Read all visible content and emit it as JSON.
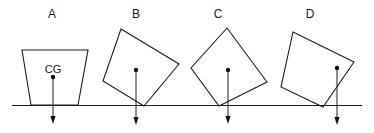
{
  "figure": {
    "colors": {
      "line": "#1e1e1e",
      "background": "#ffffff"
    },
    "ground": {
      "x1": 12,
      "y1": 105.5,
      "x2": 362,
      "y2": 105.5
    },
    "cg_label": "CG",
    "objects": [
      {
        "id": "A",
        "label": "A",
        "label_pos": [
          52,
          18
        ],
        "points": "22,50 88,50 78,105 31,105",
        "cg": [
          53,
          77
        ],
        "arrow_end_y": 124,
        "show_cg_label": true,
        "cg_label_pos": [
          53,
          73
        ]
      },
      {
        "id": "B",
        "label": "B",
        "label_pos": [
          136,
          18
        ],
        "points": "121,29 179,64 144,106 103,81",
        "cg": [
          136,
          70
        ],
        "arrow_end_y": 125,
        "show_cg_label": false
      },
      {
        "id": "C",
        "label": "C",
        "label_pos": [
          218,
          18
        ],
        "points": "227,28 267,82 219,106 191,68",
        "cg": [
          228,
          70
        ],
        "arrow_end_y": 124,
        "show_cg_label": false
      },
      {
        "id": "D",
        "label": "D",
        "label_pos": [
          310,
          18
        ],
        "points": "293,32 354,62 323,107 281,87",
        "cg": [
          337,
          68
        ],
        "arrow_end_y": 125,
        "show_cg_label": false
      }
    ]
  }
}
